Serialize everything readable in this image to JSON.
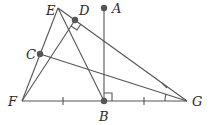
{
  "diagram": {
    "points": {
      "E": {
        "label": "E",
        "x": 58,
        "y": 8
      },
      "D": {
        "label": "D",
        "x": 75,
        "y": 20
      },
      "A": {
        "label": "A",
        "x": 104,
        "y": 8
      },
      "C": {
        "label": "C",
        "x": 40,
        "y": 54
      },
      "F": {
        "label": "F",
        "x": 22,
        "y": 101
      },
      "B": {
        "label": "B",
        "x": 104,
        "y": 101
      },
      "G": {
        "label": "G",
        "x": 187,
        "y": 101
      }
    },
    "segments": [
      "EF",
      "EB",
      "EG",
      "FD",
      "CG",
      "FG",
      "AB"
    ],
    "marks": {
      "right_angle_at": [
        "D",
        "B"
      ],
      "equal_ticks": [
        "FB",
        "BG"
      ],
      "equal_angles_at": "G"
    },
    "line_color": "#555555",
    "point_color": "#555555"
  }
}
